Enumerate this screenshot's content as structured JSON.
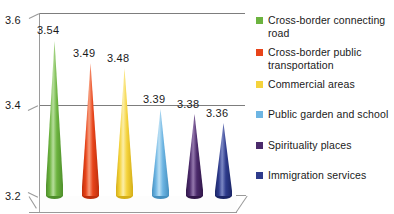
{
  "chart_data": {
    "type": "bar",
    "title": "",
    "subtitle": "",
    "xlabel": "",
    "ylabel": "",
    "ylim": [
      3.2,
      3.6
    ],
    "ytick_labels": [
      "3.6",
      "3.4",
      "3.2"
    ],
    "ytick_values": [
      3.6,
      3.4,
      3.2
    ],
    "grid": true,
    "legend_position": "right",
    "style": "3d-cone",
    "categories": [
      "Cross-border connecting road",
      "Cross-border public transportation",
      "Commercial areas",
      "Public garden and school",
      "Spirituality places",
      "Immigration services"
    ],
    "values": [
      3.54,
      3.49,
      3.48,
      3.39,
      3.38,
      3.36
    ],
    "data_labels": [
      "3.54",
      "3.49",
      "3.48",
      "3.39",
      "3.38",
      "3.36"
    ],
    "colors": [
      "#6CB33F",
      "#E8441A",
      "#F5D33C",
      "#6DB5E3",
      "#4B2A6B",
      "#2E3B8C"
    ],
    "series": [
      {
        "name": "Mean score",
        "values": [
          3.54,
          3.49,
          3.48,
          3.39,
          3.38,
          3.36
        ]
      }
    ]
  },
  "axis": {
    "y_top": "3.6",
    "y_mid": "3.4",
    "y_bottom": "3.2"
  },
  "bars": [
    {
      "label": "3.54",
      "value": 3.54,
      "color": "#6CB33F",
      "highlight": "#B6DE9B",
      "shade": "#4E8F2B"
    },
    {
      "label": "3.49",
      "value": 3.49,
      "color": "#E8441A",
      "highlight": "#F79E7E",
      "shade": "#BE2F0C"
    },
    {
      "label": "3.48",
      "value": 3.48,
      "color": "#F5D33C",
      "highlight": "#FBEEA8",
      "shade": "#D4AE17"
    },
    {
      "label": "3.39",
      "value": 3.39,
      "color": "#6DB5E3",
      "highlight": "#BCE0F4",
      "shade": "#4690BF"
    },
    {
      "label": "3.38",
      "value": 3.38,
      "color": "#4B2A6B",
      "highlight": "#9478AD",
      "shade": "#31174A"
    },
    {
      "label": "3.36",
      "value": 3.36,
      "color": "#2E3B8C",
      "highlight": "#7C88C4",
      "shade": "#1B2566"
    }
  ],
  "legend": {
    "items": [
      {
        "label": "Cross-border connecting road",
        "color": "#6CB33F"
      },
      {
        "label": "Cross-border public transportation",
        "color": "#E8441A"
      },
      {
        "label": "Commercial areas",
        "color": "#F5D33C"
      },
      {
        "label": "Public garden and school",
        "color": "#6DB5E3"
      },
      {
        "label": "Spirituality places",
        "color": "#4B2A6B"
      },
      {
        "label": "Immigration services",
        "color": "#2E3B8C"
      }
    ]
  }
}
